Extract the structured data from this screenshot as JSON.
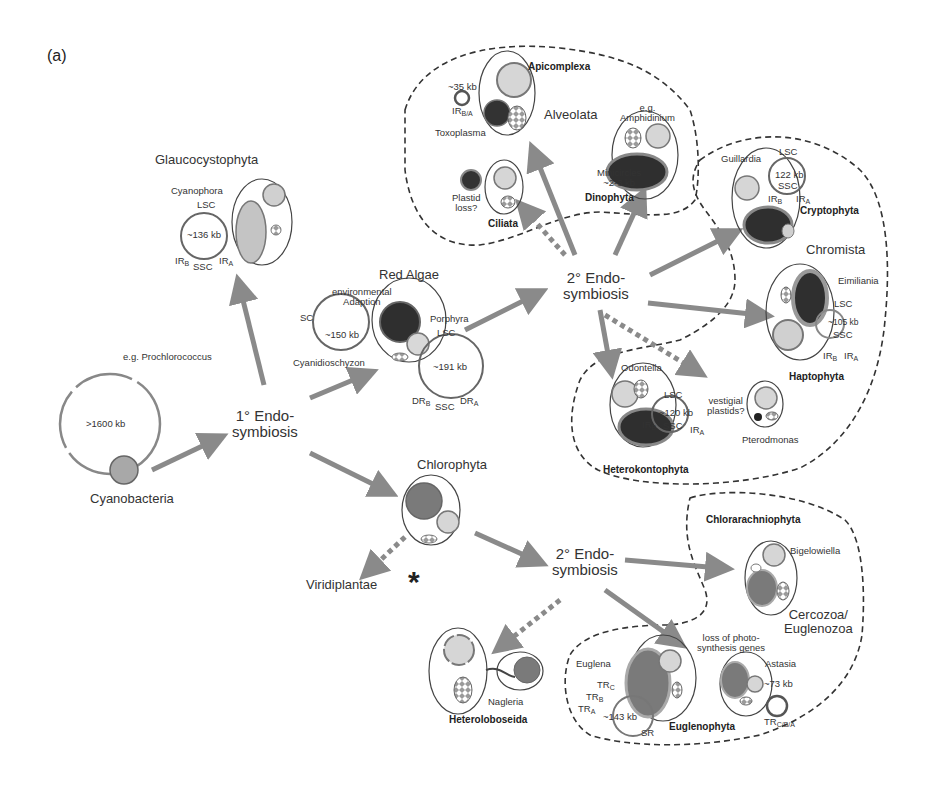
{
  "panel_label": "(a)",
  "colors": {
    "arrow": "#8a8a8a",
    "nucleus_light": "#d0d0d0",
    "plastid_dark": "#2e2e2e",
    "plastid_mid": "#7a7a7a",
    "dashed_boundary": "#333333"
  },
  "nodes": {
    "cyanobacteria": {
      "label": "Cyanobacteria",
      "example": "e.g. Prochlorococcus",
      "genome": ">1600 kb"
    },
    "primary_endo": {
      "line1": "1° Endo-",
      "line2": "symbiosis"
    },
    "glaucocystophyta": {
      "label": "Glaucocystophyta",
      "species": "Cyanophora",
      "lsc": "LSC",
      "genome": "~136 kb",
      "irb": "IR",
      "irb_sub": "B",
      "ssc": "SSC",
      "ira": "IR",
      "ira_sub": "A"
    },
    "red_algae": {
      "label": "Red Algae",
      "env_line1": "environmental",
      "env_line2": "Adaption",
      "sc": "SC",
      "genome_small": "~150 kb",
      "species_small": "Cyanidioschyzon",
      "species_large": "Porphyra",
      "lsc": "LSC",
      "genome_large": "~191 kb",
      "drb": "DR",
      "drb_sub": "B",
      "ssc": "SSC",
      "dra": "DR",
      "dra_sub": "A"
    },
    "secondary_endo_top": {
      "line1": "2° Endo-",
      "line2": "symbiosis"
    },
    "alveolata": {
      "label": "Alveolata",
      "apicomplexa": "Apicomplexa",
      "api_genome": "~35 kb",
      "api_ir": "IR",
      "api_ir_sub": "B/A",
      "api_species": "Toxoplasma",
      "ciliata": "Ciliata",
      "plastid_loss_1": "Plastid",
      "plastid_loss_2": "loss?",
      "dino_eg": "e.g.",
      "dino_species": "Amphidinium",
      "minicircles_1": "Minicircles",
      "minicircles_2": "~2-3 kb",
      "dinophyta": "Dinophyta"
    },
    "chromista": {
      "label": "Chromista",
      "crypto_species": "Guillardia",
      "crypto_lsc": "LSC",
      "crypto_genome": "122 kb",
      "crypto_ssc": "SSC",
      "crypto_irb": "IR",
      "crypto_irb_sub": "B",
      "crypto_ira": "IR",
      "crypto_ira_sub": "A",
      "cryptophyta": "Cryptophyta",
      "hapto_species": "Eimiliania",
      "hapto_lsc": "LSC",
      "hapto_genome": "~105 kb",
      "hapto_ssc": "SSC",
      "hapto_irb": "IR",
      "hapto_irb_sub": "B",
      "hapto_ira": "IR",
      "hapto_ira_sub": "A",
      "haptophyta": "Haptophyta",
      "hetero_species": "Odontella",
      "hetero_lsc": "LSC",
      "hetero_genome": "~120 kb",
      "hetero_irb": "IR",
      "hetero_irb_sub": "B",
      "hetero_ssc": "SSC",
      "hetero_ira": "IR",
      "hetero_ira_sub": "A",
      "heterokontophyta": "Heterokontophyta",
      "vestigial_1": "vestigial",
      "vestigial_2": "plastids?",
      "ptero_species": "Pterodmonas"
    },
    "chlorophyta": {
      "label": "Chlorophyta"
    },
    "viridiplantae": {
      "label": "Viridiplantae",
      "marker": "*"
    },
    "secondary_endo_bottom": {
      "line1": "2° Endo-",
      "line2": "symbiosis"
    },
    "cercozoa": {
      "label_line1": "Cercozoa/",
      "label_line2": "Euglenozoa",
      "chlorarachniophyta": "Chlorarachniophyta",
      "chlorarach_species": "Bigelowiella",
      "loss_1": "loss of photo-",
      "loss_2": "synthesis genes",
      "astasia": "Astasia",
      "astasia_genome": "~73 kb",
      "astasia_tr": "TR",
      "astasia_tr_sub": "C/B/A",
      "euglena": "Euglena",
      "trc": "TR",
      "trc_sub": "C",
      "trb": "TR",
      "trb_sub": "B",
      "tra": "TR",
      "tra_sub": "A",
      "euglena_genome": "~143 kb",
      "sr": "SR",
      "euglenophyta": "Euglenophyta"
    },
    "heterolobosea": {
      "species": "Nagleria",
      "label": "Heteroloboseida"
    }
  }
}
